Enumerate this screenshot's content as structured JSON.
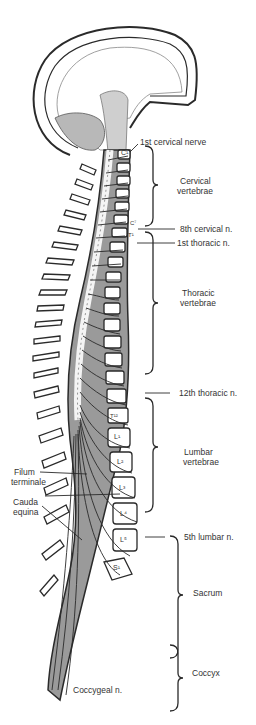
{
  "diagram": {
    "colors": {
      "outline": "#2a2a2a",
      "nerve_tissue": "#9a9a9a",
      "bone": "#ffffff",
      "background": "#ffffff"
    },
    "labels": {
      "first_cervical_nerve": "1st cervical nerve",
      "cervical_vertebrae_1": "Cervical",
      "cervical_vertebrae_2": "vertebrae",
      "eighth_cervical_n": "8th cervical n.",
      "first_thoracic_n": "1st thoracic n.",
      "thoracic_vertebrae_1": "Thoracic",
      "thoracic_vertebrae_2": "vertebrae",
      "twelfth_thoracic_n": "12th thoracic n.",
      "lumbar_vertebrae_1": "Lumbar",
      "lumbar_vertebrae_2": "vertebrae",
      "fifth_lumbar_n": "5th lumbar n.",
      "sacrum": "Sacrum",
      "coccyx": "Coccyx",
      "coccygeal_n": "Coccygeal n.",
      "filum_terminale_1": "Filum",
      "filum_terminale_2": "terminale",
      "cauda_equina_1": "Cauda",
      "cauda_equina_2": "equina"
    },
    "vertebra_marks": {
      "c1": "C¹",
      "c7": "C⁷",
      "t1": "T¹",
      "t12": "T¹²",
      "l1": "L¹",
      "l2": "L²",
      "l3": "L³",
      "l4": "L⁴",
      "l5": "L⁵",
      "s1": "S¹"
    }
  }
}
